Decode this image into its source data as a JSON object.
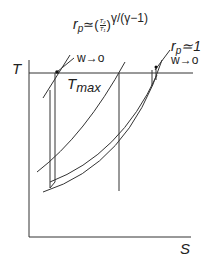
{
  "diagram": {
    "type": "T-s diagram (Brayton cycle, limiting pressure ratios)",
    "axes": {
      "y_label": "T",
      "x_label": "S"
    },
    "tmax_label": "T",
    "tmax_subscript": "max",
    "annotation_left": {
      "rp_symbol": "r",
      "rp_subscript": "p",
      "approx": "≃",
      "ratio_numerator": "T₂",
      "ratio_denominator": "T₁",
      "exponent": "γ/(γ−1)",
      "work": "w→o"
    },
    "annotation_right": {
      "rp_symbol": "r",
      "rp_subscript": "p",
      "approx": "≃1",
      "work": "w→o"
    },
    "colors": {
      "line": "#333333",
      "text": "#222222",
      "background": "#ffffff"
    }
  }
}
